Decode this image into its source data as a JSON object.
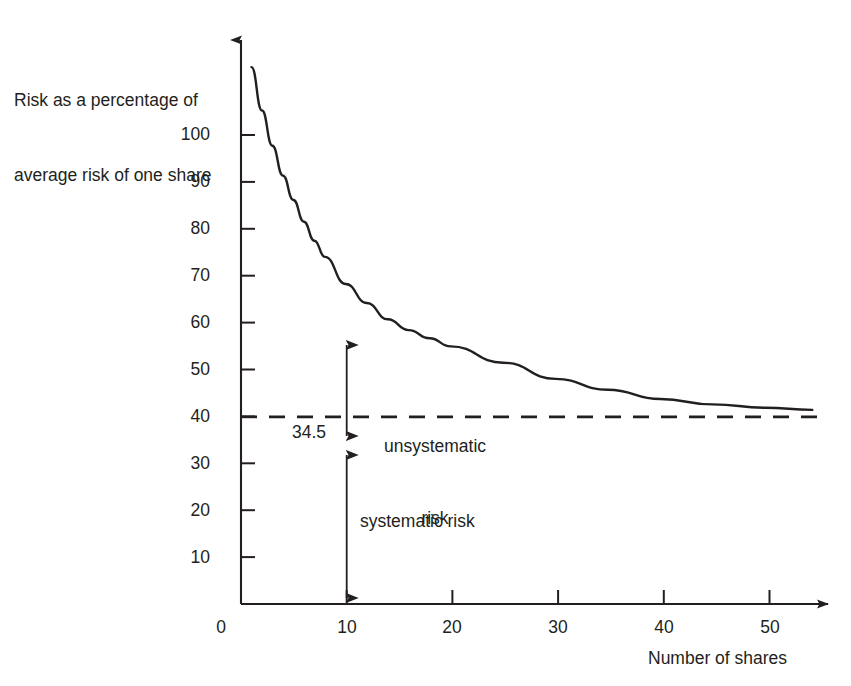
{
  "chart_data": {
    "type": "line",
    "title": "",
    "xlabel": "Number of shares",
    "ylabel": "Risk as a percentage of average risk of one share",
    "ylabel_line1": "Risk as a percentage of",
    "ylabel_line2": "average risk of one share",
    "xlim": [
      0,
      56
    ],
    "ylim": [
      0,
      104
    ],
    "xticks": [
      "0",
      "10",
      "20",
      "30",
      "40",
      "50"
    ],
    "xtick_values": [
      0,
      10,
      20,
      30,
      40,
      50
    ],
    "yticks": [
      "0",
      "10",
      "20",
      "30",
      "40",
      "50",
      "60",
      "70",
      "80",
      "90",
      "100"
    ],
    "ytick_values": [
      0,
      10,
      20,
      30,
      40,
      50,
      60,
      70,
      80,
      90,
      100
    ],
    "grid": false,
    "legend": "none",
    "series": [
      {
        "name": "Portfolio risk",
        "x": [
          1,
          2,
          3,
          4,
          5,
          6,
          7,
          8,
          10,
          12,
          14,
          16,
          18,
          20,
          25,
          30,
          35,
          40,
          45,
          50,
          54.5
        ],
        "values": [
          99,
          91,
          84.5,
          79,
          74.5,
          70.5,
          67,
          64,
          59,
          55.5,
          52.5,
          50.5,
          49,
          47.5,
          44.5,
          41.5,
          39.5,
          37.8,
          36.8,
          36.2,
          35.8
        ]
      }
    ],
    "reference_line": {
      "label": "34.5",
      "value": 34.5,
      "style": "dashed"
    },
    "annotations": [
      {
        "name": "unsystematic-risk",
        "text_line1": "unsystematic",
        "text_line2": "risk",
        "text": "unsystematic risk",
        "arrow": "double-headed-vertical",
        "at_x": 10,
        "from_value": 57,
        "to_value": 34.5
      },
      {
        "name": "systematic-risk",
        "text": "systematic risk",
        "arrow": "double-headed-vertical",
        "at_x": 10,
        "from_value": 34.5,
        "to_value": 0
      }
    ],
    "colors": {
      "line": "#231f20",
      "axis": "#231f20",
      "text": "#231f20",
      "background": "#ffffff"
    }
  },
  "top_artifact": {
    "text": "· · ·"
  }
}
